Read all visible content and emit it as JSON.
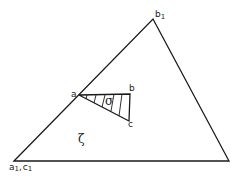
{
  "diagram": {
    "outer_triangle": {
      "vertices": {
        "a1_c1": [
          14,
          161
        ],
        "b1": [
          153,
          19
        ],
        "right": [
          229,
          161
        ]
      },
      "region_label": "ζ"
    },
    "inner_triangle": {
      "vertices": {
        "a": [
          79,
          95
        ],
        "b": [
          130,
          94
        ],
        "c": [
          129,
          121
        ]
      },
      "region_label": "σ",
      "hatched": true
    },
    "labels": {
      "b1": "b",
      "b1_sub": "1",
      "a": "a",
      "b": "b",
      "c": "c",
      "sigma": "σ",
      "zeta": "ζ",
      "a1c1_a": "a",
      "a1c1_a_sub": "1",
      "a1c1_sep": ",",
      "a1c1_c": "c",
      "a1c1_c_sub": "1"
    },
    "colors": {
      "stroke": "#1a1a1a",
      "background": "#ffffff"
    }
  }
}
